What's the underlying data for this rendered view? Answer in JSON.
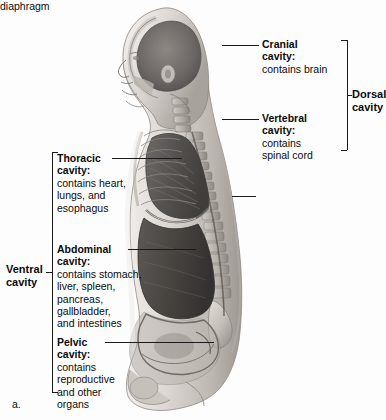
{
  "figure": {
    "caption": "a.",
    "alt_name": "sagittal-section-body-cavities"
  },
  "labels": {
    "cranial": {
      "heading": "Cranial",
      "heading2": "cavity:",
      "body": "contains brain"
    },
    "vertebral": {
      "heading": "Vertebral",
      "heading2": "cavity:",
      "body": "contains\nspinal cord"
    },
    "diaphragm": {
      "text": "diaphragm"
    },
    "dorsal": {
      "line1": "Dorsal",
      "line2": "cavity"
    },
    "thoracic": {
      "heading": "Thoracic",
      "heading2": "cavity:",
      "body": "contains heart,\nlungs, and\nesophagus"
    },
    "abdominal": {
      "heading": "Abdominal",
      "heading2": "cavity:",
      "body": "contains stomach,\nliver, spleen,\npancreas,\ngallbladder,\nand intestines"
    },
    "pelvic": {
      "heading": "Pelvic",
      "heading2": "cavity:",
      "body": "contains\nreproductive\nand other\norgans"
    },
    "ventral": {
      "line1": "Ventral",
      "line2": "cavity"
    }
  },
  "colors": {
    "background": "#fdfdfd",
    "text": "#0b0b0b",
    "leader_line": "#1a1a1a",
    "skin_light": "#e9e6e3",
    "skin_mid": "#c9c4c0",
    "skin_shadow": "#9a948f",
    "cavity_dark": "#55524f",
    "cavity_darker": "#3d3a38",
    "bone_light": "#d9d5d1",
    "bone_mid": "#b0aba6"
  }
}
